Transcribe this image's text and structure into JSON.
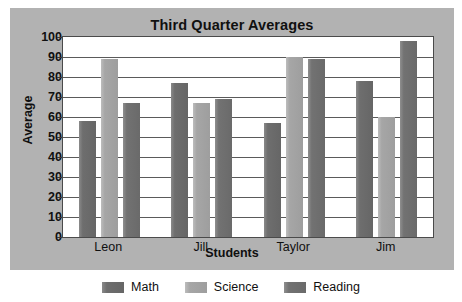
{
  "chart_data": {
    "type": "bar",
    "title": "Third Quarter Averages",
    "xlabel": "Students",
    "ylabel": "Average",
    "categories": [
      "Leon",
      "Jill",
      "Taylor",
      "Jim"
    ],
    "series": [
      {
        "name": "Math",
        "color": "#6e6e6e",
        "values": [
          58,
          77,
          57,
          78
        ]
      },
      {
        "name": "Science",
        "color": "#a6a6a6",
        "values": [
          89,
          67,
          90,
          60
        ]
      },
      {
        "name": "Reading",
        "color": "#727272",
        "values": [
          67,
          69,
          89,
          98
        ]
      }
    ],
    "ylim": [
      0,
      100
    ],
    "ytick_step": 10,
    "yticks": [
      "100",
      "90",
      "80",
      "70",
      "60",
      "50",
      "40",
      "30",
      "20",
      "10",
      "0"
    ],
    "grid": true,
    "legend_position": "bottom",
    "plot_background": "#ffffff",
    "panel_background": "#b2b2b2"
  },
  "legend": {
    "items": [
      {
        "label": "Math"
      },
      {
        "label": "Science"
      },
      {
        "label": "Reading"
      }
    ]
  }
}
